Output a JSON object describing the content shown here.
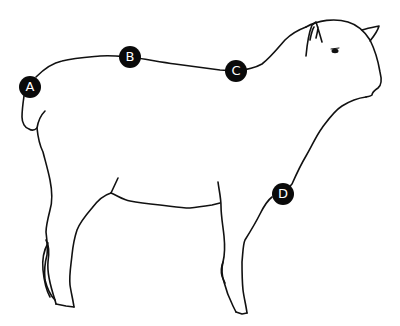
{
  "figure": {
    "background_color": "#ffffff",
    "line_color": "#111111",
    "marker_color": "#0a0a0a",
    "marker_text_color": "#ffffff"
  },
  "markers": [
    {
      "label": "A",
      "x": 30,
      "y": 87
    },
    {
      "label": "B",
      "x": 130,
      "y": 57
    },
    {
      "label": "C",
      "x": 236,
      "y": 71
    },
    {
      "label": "D",
      "x": 283,
      "y": 194
    }
  ]
}
